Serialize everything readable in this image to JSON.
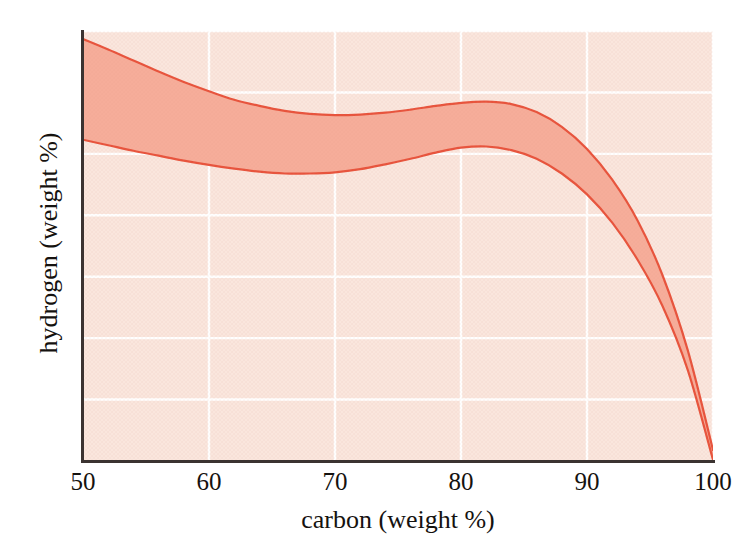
{
  "figure": {
    "background_color": "#FFFFFF",
    "plot_background_color": "#FAE6DD",
    "gridline_color": "#FFFFFF",
    "axis_color": "#3B3331"
  },
  "axes": {
    "x_title": "carbon (weight %)",
    "y_title": "hydrogen (weight %)",
    "x_ticks": [
      "50",
      "60",
      "70",
      "80",
      "90",
      "100"
    ],
    "y_ticks": [
      "0",
      "1",
      "2",
      "3",
      "4",
      "5",
      "6",
      "7"
    ]
  },
  "bleed_through": {
    "line1": "",
    "line2": ""
  },
  "chart_data": {
    "type": "area",
    "title": "",
    "subtitle": "",
    "xlabel": "carbon (weight %)",
    "ylabel": "hydrogen (weight %)",
    "xlim": [
      50,
      100
    ],
    "ylim": [
      0,
      7
    ],
    "xticks": [
      50,
      60,
      70,
      80,
      90,
      100
    ],
    "yticks": [
      0,
      1,
      2,
      3,
      4,
      5,
      6,
      7
    ],
    "grid": true,
    "grid_color": "#FFFFFF",
    "legend": null,
    "band_fill_color": "#F6AD9A",
    "band_line_color": "#E8533C",
    "band_line_width": 2.2,
    "annotations": [],
    "x": [
      50,
      52,
      54,
      56,
      58,
      60,
      62,
      64,
      66,
      68,
      70,
      72,
      74,
      76,
      78,
      80,
      82,
      84,
      86,
      88,
      90,
      92,
      94,
      96,
      98,
      100
    ],
    "series": [
      {
        "name": "upper bound",
        "values": [
          6.87,
          6.7,
          6.52,
          6.34,
          6.17,
          6.02,
          5.88,
          5.78,
          5.7,
          5.65,
          5.63,
          5.64,
          5.67,
          5.72,
          5.78,
          5.83,
          5.85,
          5.81,
          5.68,
          5.44,
          5.08,
          4.58,
          3.92,
          3.02,
          1.8,
          0.18
        ]
      },
      {
        "name": "lower bound",
        "values": [
          5.23,
          5.14,
          5.05,
          4.97,
          4.89,
          4.82,
          4.76,
          4.71,
          4.68,
          4.68,
          4.7,
          4.75,
          4.83,
          4.92,
          5.02,
          5.1,
          5.12,
          5.06,
          4.92,
          4.68,
          4.34,
          3.88,
          3.28,
          2.52,
          1.48,
          0.02
        ]
      }
    ]
  }
}
